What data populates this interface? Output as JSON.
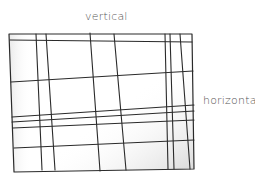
{
  "labels": {
    "vertical": "vertical",
    "horizontal": "horizontal"
  },
  "colors": {
    "line": "#2a2a2a",
    "text": "#555555",
    "background": "#ffffff",
    "shade": "#d8d8d8"
  },
  "figure": {
    "frame": {
      "top_left": [
        9,
        34
      ],
      "top_right": [
        192,
        34
      ],
      "bottom_right": [
        194,
        169
      ],
      "bottom_left": [
        14,
        172
      ]
    },
    "vertical_lines": [
      {
        "x1": 36,
        "y1": 34,
        "x2": 42,
        "y2": 170
      },
      {
        "x1": 46,
        "y1": 34,
        "x2": 55,
        "y2": 170
      },
      {
        "x1": 90,
        "y1": 33,
        "x2": 100,
        "y2": 171
      },
      {
        "x1": 114,
        "y1": 34,
        "x2": 126,
        "y2": 170
      },
      {
        "x1": 165,
        "y1": 34,
        "x2": 168,
        "y2": 169
      },
      {
        "x1": 170,
        "y1": 34,
        "x2": 174,
        "y2": 169
      },
      {
        "x1": 180,
        "y1": 34,
        "x2": 190,
        "y2": 169
      }
    ],
    "horizontal_lines": [
      {
        "x1": 10,
        "y1": 40,
        "x2": 192,
        "y2": 42
      },
      {
        "x1": 11,
        "y1": 82,
        "x2": 193,
        "y2": 71
      },
      {
        "x1": 12,
        "y1": 117,
        "x2": 194,
        "y2": 105
      },
      {
        "x1": 12,
        "y1": 122,
        "x2": 194,
        "y2": 111
      },
      {
        "x1": 13,
        "y1": 128,
        "x2": 194,
        "y2": 120
      },
      {
        "x1": 14,
        "y1": 148,
        "x2": 194,
        "y2": 140
      }
    ]
  }
}
